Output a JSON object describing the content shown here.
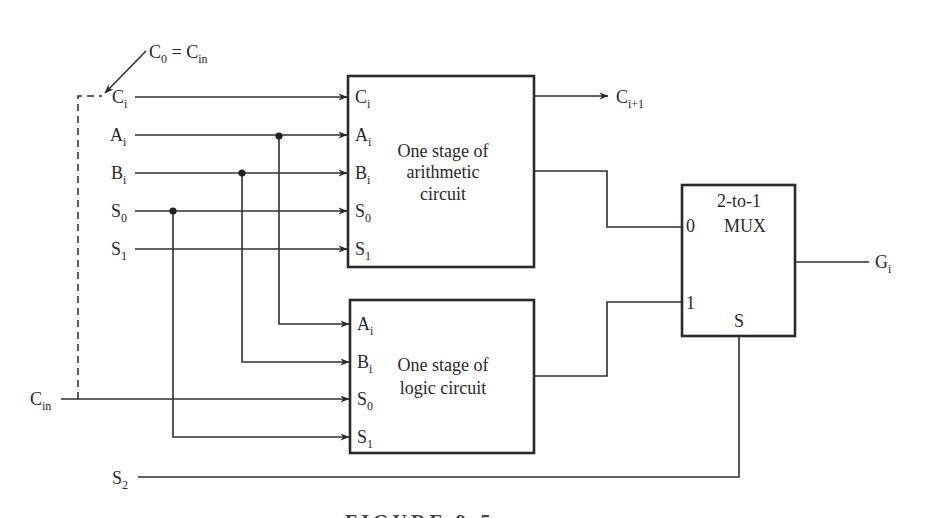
{
  "diagram": {
    "annotation": {
      "c0": "C",
      "c0_sub": "0",
      "eq": " = ",
      "cin": "C",
      "cin_sub": "in"
    },
    "inputs": [
      {
        "name": "C",
        "sub": "i"
      },
      {
        "name": "A",
        "sub": "i"
      },
      {
        "name": "B",
        "sub": "i"
      },
      {
        "name": "S",
        "sub": "0"
      },
      {
        "name": "S",
        "sub": "1"
      }
    ],
    "cin_input": {
      "name": "C",
      "sub": "in"
    },
    "s2_input": {
      "name": "S",
      "sub": "2"
    },
    "arithmetic_block": {
      "title_lines": [
        "One stage of",
        "arithmetic",
        "circuit"
      ],
      "ports": [
        {
          "name": "C",
          "sub": "i"
        },
        {
          "name": "A",
          "sub": "i"
        },
        {
          "name": "B",
          "sub": "i"
        },
        {
          "name": "S",
          "sub": "0"
        },
        {
          "name": "S",
          "sub": "1"
        }
      ],
      "carry_out": {
        "name": "C",
        "sub": "i+1"
      }
    },
    "logic_block": {
      "title_lines": [
        "One stage of",
        "logic circuit"
      ],
      "ports": [
        {
          "name": "A",
          "sub": "i"
        },
        {
          "name": "B",
          "sub": "i"
        },
        {
          "name": "S",
          "sub": "0"
        },
        {
          "name": "S",
          "sub": "1"
        }
      ]
    },
    "mux": {
      "title_lines": [
        "2-to-1",
        "MUX"
      ],
      "input0": "0",
      "input1": "1",
      "select": "S",
      "output": {
        "name": "G",
        "sub": "i"
      }
    },
    "caption": "FIGURE 9-5"
  }
}
